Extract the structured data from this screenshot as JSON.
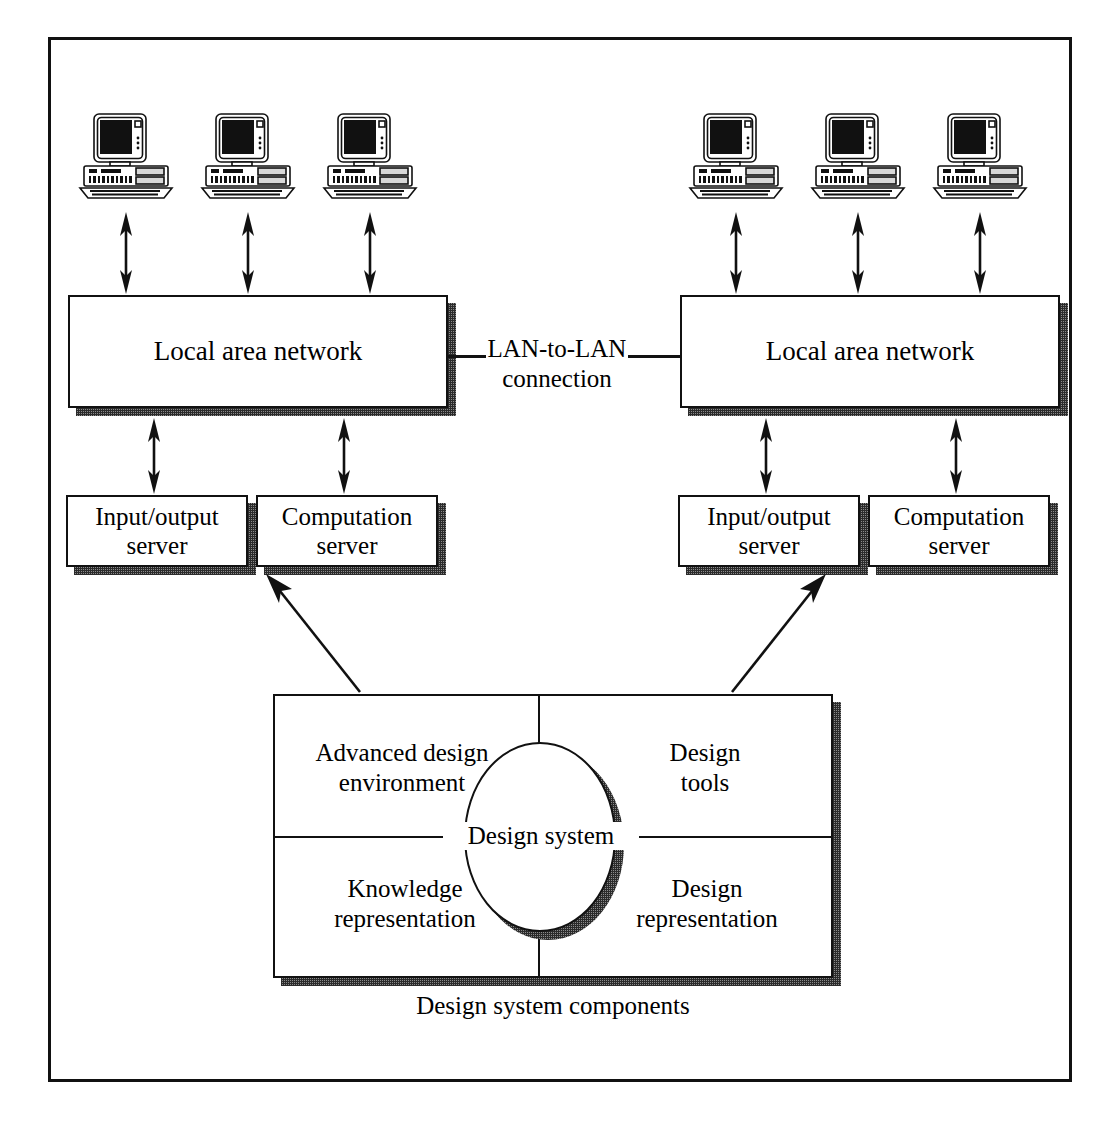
{
  "figure": {
    "caption": "Design system components",
    "connection_label_line1": "LAN-to-LAN",
    "connection_label_line2": "connection",
    "ink_color": "#111111",
    "shadow_color": "#8a8a8a",
    "background_color": "#ffffff"
  },
  "networks": [
    {
      "id": "left",
      "label": "Local area network",
      "workstations": [
        {
          "name": "workstation-left-1",
          "icon": "desktop-computer-icon"
        },
        {
          "name": "workstation-left-2",
          "icon": "desktop-computer-icon"
        },
        {
          "name": "workstation-left-3",
          "icon": "desktop-computer-icon"
        }
      ],
      "servers": [
        {
          "line1": "Input/output",
          "line2": "server"
        },
        {
          "line1": "Computation",
          "line2": "server"
        }
      ]
    },
    {
      "id": "right",
      "label": "Local area network",
      "workstations": [
        {
          "name": "workstation-right-1",
          "icon": "desktop-computer-icon"
        },
        {
          "name": "workstation-right-2",
          "icon": "desktop-computer-icon"
        },
        {
          "name": "workstation-right-3",
          "icon": "desktop-computer-icon"
        }
      ],
      "servers": [
        {
          "line1": "Input/output",
          "line2": "server"
        },
        {
          "line1": "Computation",
          "line2": "server"
        }
      ]
    }
  ],
  "design_system": {
    "center_label": "Design system",
    "quadrants": {
      "top_left_line1": "Advanced design",
      "top_left_line2": "environment",
      "top_right_line1": "Design",
      "top_right_line2": "tools",
      "bottom_left_line1": "Knowledge",
      "bottom_left_line2": "representation",
      "bottom_right_line1": "Design",
      "bottom_right_line2": "representation"
    }
  }
}
